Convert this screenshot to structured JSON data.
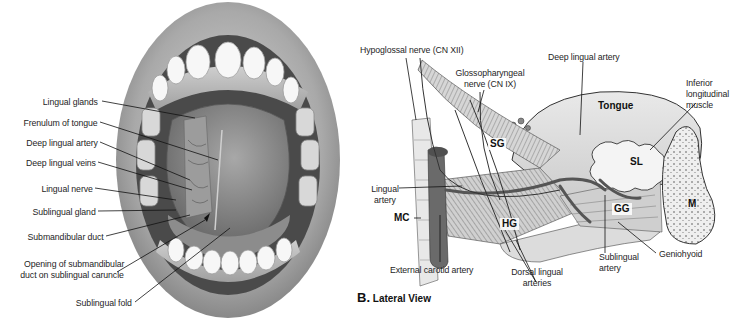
{
  "panel_a": {
    "title": "Inferior surface of tongue (open mouth)",
    "labels": [
      {
        "id": "lingual-glands",
        "text": "Lingual glands"
      },
      {
        "id": "frenulum-of-tongue",
        "text": "Frenulum of tongue"
      },
      {
        "id": "deep-lingual-artery",
        "text": "Deep lingual artery"
      },
      {
        "id": "deep-lingual-veins",
        "text": "Deep lingual veins"
      },
      {
        "id": "lingual-nerve",
        "text": "Lingual nerve"
      },
      {
        "id": "sublingual-gland",
        "text": "Sublingual gland"
      },
      {
        "id": "submandibular-duct",
        "text": "Submandibular duct"
      },
      {
        "id": "opening-submandibular-duct-line1",
        "text": "Opening of submandibular"
      },
      {
        "id": "opening-submandibular-duct-line2",
        "text": "duct on sublingual caruncle"
      },
      {
        "id": "sublingual-fold",
        "text": "Sublingual fold"
      }
    ]
  },
  "panel_b": {
    "letter": "B.",
    "title": "Lateral View",
    "labels": [
      {
        "id": "hypoglossal-nerve",
        "text": "Hypoglossal nerve (CN XII)"
      },
      {
        "id": "glossopharyngeal-line1",
        "text": "Glossopharyngeal"
      },
      {
        "id": "glossopharyngeal-line2",
        "text": "nerve (CN IX)"
      },
      {
        "id": "deep-lingual-artery",
        "text": "Deep lingual artery"
      },
      {
        "id": "inferior-longitudinal-line1",
        "text": "Inferior"
      },
      {
        "id": "inferior-longitudinal-line2",
        "text": "longitudinal"
      },
      {
        "id": "inferior-longitudinal-line3",
        "text": "muscle"
      },
      {
        "id": "lingual-artery-line1",
        "text": "Lingual"
      },
      {
        "id": "lingual-artery-line2",
        "text": "artery"
      },
      {
        "id": "external-carotid-artery",
        "text": "External carotid artery"
      },
      {
        "id": "dorsal-lingual-line1",
        "text": "Dorsal lingual"
      },
      {
        "id": "dorsal-lingual-line2",
        "text": "arteries"
      },
      {
        "id": "sublingual-artery-line1",
        "text": "Sublingual"
      },
      {
        "id": "sublingual-artery-line2",
        "text": "artery"
      },
      {
        "id": "geniohyoid",
        "text": "Geniohyoid"
      }
    ],
    "abbreviations": [
      {
        "id": "tongue",
        "text": "Tongue"
      },
      {
        "id": "sg",
        "text": "SG"
      },
      {
        "id": "sl",
        "text": "SL"
      },
      {
        "id": "hg",
        "text": "HG"
      },
      {
        "id": "gg",
        "text": "GG"
      },
      {
        "id": "mc",
        "text": "MC"
      },
      {
        "id": "m",
        "text": "M"
      }
    ]
  }
}
